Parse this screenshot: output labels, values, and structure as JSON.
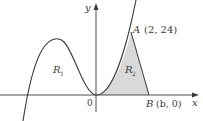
{
  "figure": {
    "axis_x_label": "x",
    "axis_y_label": "y",
    "origin_label": "0",
    "region1": {
      "name": "R",
      "sub": "1"
    },
    "region2": {
      "name": "R",
      "sub": "2"
    },
    "point_A": {
      "name": "A",
      "coords": "(2, 24)"
    },
    "point_B": {
      "name": "B",
      "coords": "(b, 0)"
    },
    "colors": {
      "curve": "#3a3a3a",
      "axis": "#3a3a3a",
      "shade": "#d9d9d9"
    }
  }
}
